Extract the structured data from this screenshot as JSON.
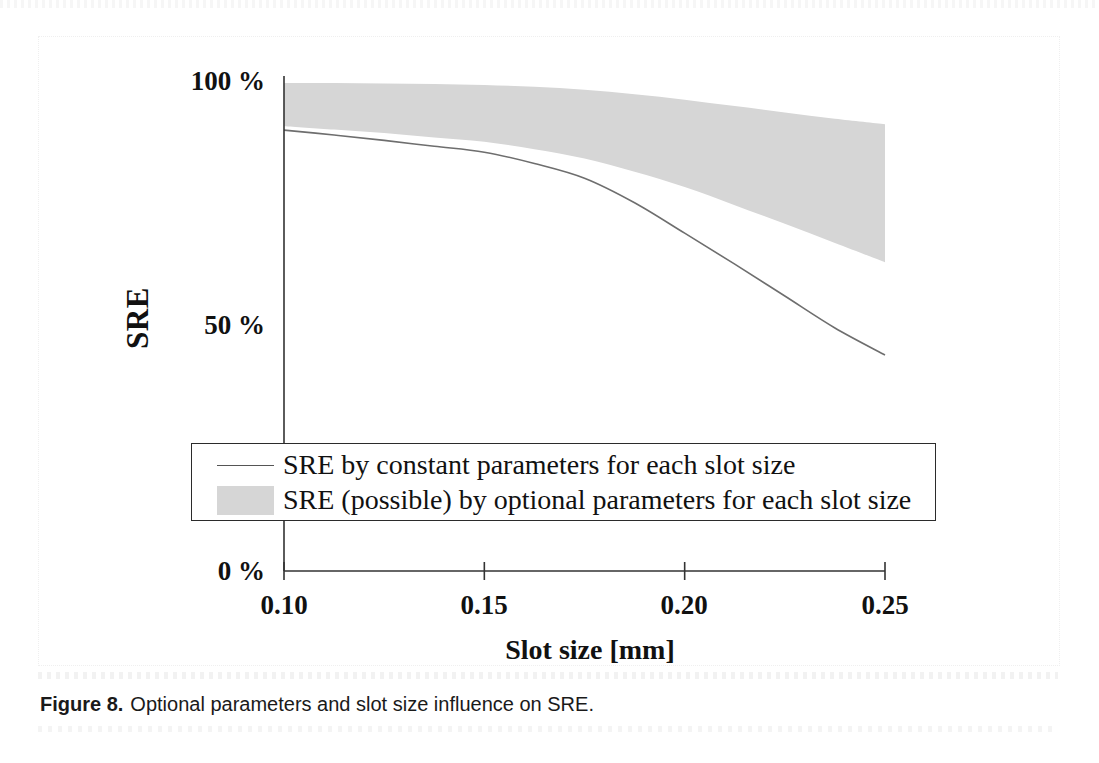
{
  "figure": {
    "caption_label": "Figure 8.",
    "caption_text": "Optional parameters and slot size influence on SRE."
  },
  "axes": {
    "y_title": "SRE",
    "x_title": "Slot size [mm]",
    "y_tick_labels": [
      "100 %",
      "50 %",
      "0 %"
    ],
    "x_tick_labels": [
      "0.10",
      "0.15",
      "0.20",
      "0.25"
    ]
  },
  "legend": {
    "items": [
      {
        "key": "line-sample",
        "label": "SRE by constant parameters for each slot size"
      },
      {
        "key": "band-sample",
        "label": "SRE (possible) by optional parameters for each slot size"
      }
    ]
  },
  "colors": {
    "band_fill": "#d6d6d6",
    "line_stroke": "#6e6e6e",
    "axis_stroke": "#333333",
    "text": "#111111",
    "background": "#ffffff"
  },
  "chart_data": {
    "type": "area",
    "title": "",
    "subtitle": "",
    "xlabel": "Slot size [mm]",
    "ylabel": "SRE",
    "xlim": [
      0.1,
      0.25
    ],
    "ylim": [
      0,
      100
    ],
    "xticks": [
      0.1,
      0.15,
      0.2,
      0.25
    ],
    "yticks": [
      0,
      50,
      100
    ],
    "ytick_labels": [
      "0 %",
      "50 %",
      "100 %"
    ],
    "xtick_labels": [
      "0.10",
      "0.15",
      "0.20",
      "0.25"
    ],
    "grid": false,
    "legend_position": "inside-bottom-left",
    "x": [
      0.1,
      0.1125,
      0.125,
      0.1375,
      0.15,
      0.1625,
      0.175,
      0.1875,
      0.2,
      0.2125,
      0.225,
      0.2375,
      0.25
    ],
    "series": [
      {
        "name": "SRE (possible) by optional parameters for each slot size - upper bound",
        "type": "band-upper",
        "values": [
          99.4,
          99.4,
          99.3,
          99.2,
          99.0,
          98.6,
          98.0,
          97.1,
          96.0,
          94.7,
          93.4,
          92.1,
          91.0
        ]
      },
      {
        "name": "SRE (possible) by optional parameters for each slot size - lower bound",
        "type": "band-lower",
        "values": [
          90.6,
          89.9,
          89.2,
          88.3,
          87.4,
          85.9,
          84.0,
          81.3,
          78.2,
          74.5,
          70.7,
          66.8,
          62.9
        ]
      },
      {
        "name": "SRE by constant parameters for each slot size",
        "type": "line",
        "values": [
          89.8,
          88.8,
          87.7,
          86.5,
          85.3,
          83.0,
          80.0,
          75.0,
          68.8,
          62.5,
          56.0,
          49.5,
          44.0
        ]
      }
    ],
    "annotations": []
  }
}
